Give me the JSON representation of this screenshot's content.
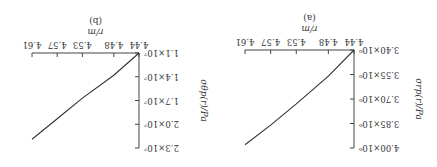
{
  "figure": {
    "orientation": "rotated 180 degrees"
  },
  "chart_data": [
    {
      "type": "line",
      "panel_label": "(a)",
      "title": "",
      "xlabel": "r/m",
      "ylabel": "σrp(r)/Pa",
      "x_ticks": [
        "4.44",
        "4.48",
        "4.53",
        "4.57",
        "4.61"
      ],
      "y_ticks": [
        "3.40×10⁶",
        "3.55×10⁶",
        "3.70×10⁶",
        "3.85×10⁶",
        "4.00×10⁶"
      ],
      "xlim": [
        4.44,
        4.61
      ],
      "ylim": [
        3400000.0,
        4000000.0
      ],
      "x": [
        4.44,
        4.48,
        4.53,
        4.57,
        4.61
      ],
      "values": [
        3400000.0,
        3560000.0,
        3730000.0,
        3860000.0,
        3980000.0
      ]
    },
    {
      "type": "line",
      "panel_label": "(b)",
      "title": "",
      "xlabel": "r/m",
      "ylabel": "σθp(r)/Pa",
      "x_ticks": [
        "4.44",
        "4.48",
        "4.53",
        "4.57",
        "4.61"
      ],
      "y_ticks": [
        "1.1×10⁷",
        "1.4×10⁷",
        "1.7×10⁷",
        "2.0×10⁷",
        "2.3×10⁷"
      ],
      "xlim": [
        4.44,
        4.61
      ],
      "ylim": [
        11000000.0,
        23000000.0
      ],
      "x": [
        4.44,
        4.48,
        4.53,
        4.57,
        4.61
      ],
      "values": [
        11000000.0,
        13800000.0,
        16700000.0,
        19300000.0,
        21900000.0
      ]
    }
  ]
}
